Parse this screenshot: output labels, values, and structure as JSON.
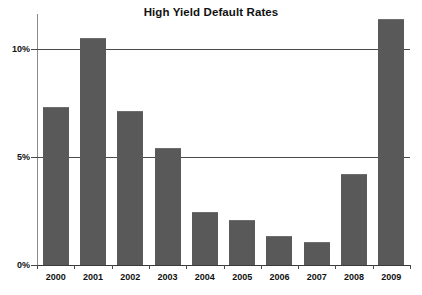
{
  "chart_data": {
    "type": "bar",
    "title": "High Yield Default Rates",
    "xlabel": "",
    "ylabel": "",
    "categories": [
      "2000",
      "2001",
      "2002",
      "2003",
      "2004",
      "2005",
      "2006",
      "2007",
      "2008",
      "2009"
    ],
    "values": [
      7.3,
      10.5,
      7.1,
      5.4,
      2.45,
      2.1,
      1.35,
      1.05,
      4.2,
      11.35
    ],
    "value_labels": [
      "7.3%",
      "10.5%",
      "7.1%",
      "5.4%",
      "2.45%",
      "2.1%",
      "1.35%",
      "1.05%",
      "4.2%",
      "11.35%"
    ],
    "ylim": [
      0,
      11.6
    ],
    "yticks": [
      0,
      5,
      10
    ],
    "ytick_labels": [
      "0%",
      "5%",
      "10%"
    ],
    "grid": true,
    "legend": "none",
    "series": [
      {
        "name": "High Yield Default Rate",
        "values": [
          7.3,
          10.5,
          7.1,
          5.4,
          2.45,
          2.1,
          1.35,
          1.05,
          4.2,
          11.35
        ]
      }
    ],
    "colors": {
      "bar": "#595959",
      "gridline": "#4a4a4a",
      "axis": "#8a8a8a",
      "text": "#111111",
      "background": "#ffffff"
    }
  }
}
